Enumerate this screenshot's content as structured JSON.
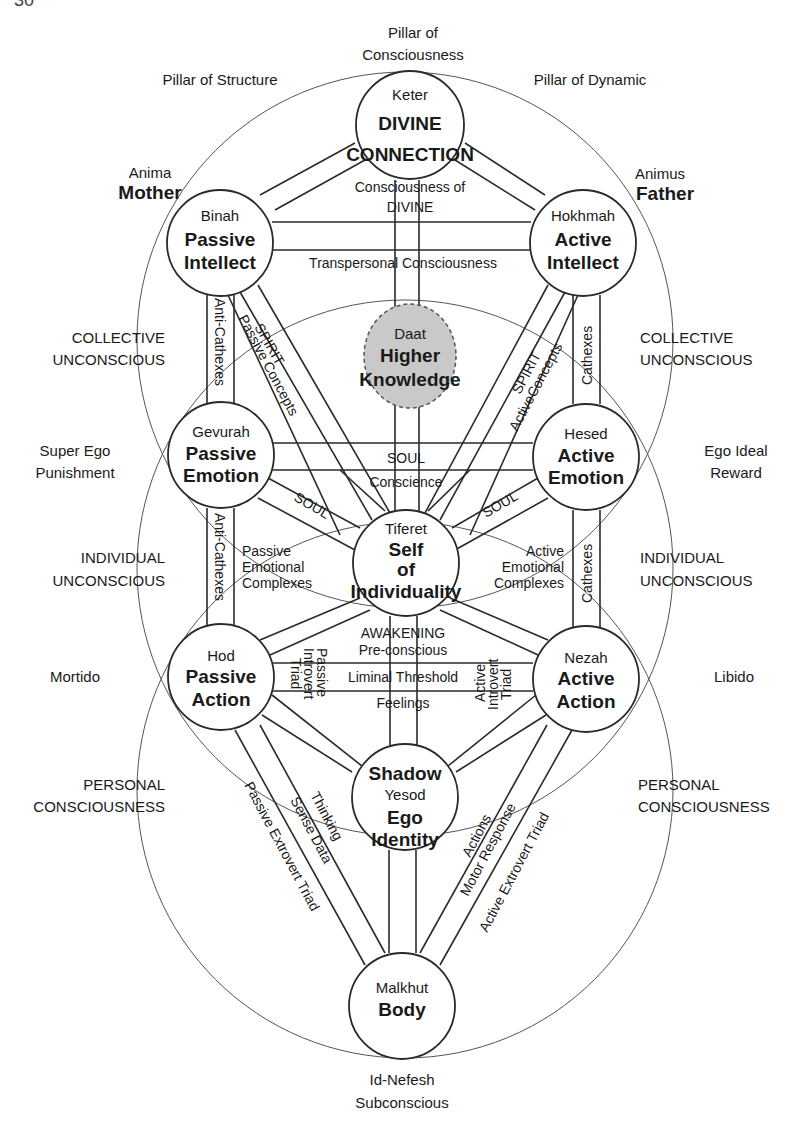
{
  "page_number": "30",
  "pillars": {
    "consciousness": [
      "Pillar of",
      "Consciousness"
    ],
    "structure": "Pillar of Structure",
    "dynamic": "Pillar of Dynamic"
  },
  "side_labels": {
    "anima": "Anima",
    "mother": "Mother",
    "animus": "Animus",
    "father": "Father",
    "collective_left": [
      "COLLECTIVE",
      "UNCONSCIOUS"
    ],
    "collective_right": [
      "COLLECTIVE",
      "UNCONSCIOUS"
    ],
    "superego": [
      "Super Ego",
      "Punishment"
    ],
    "egoideal": [
      "Ego Ideal",
      "Reward"
    ],
    "individual_left": [
      "INDIVIDUAL",
      "UNCONSCIOUS"
    ],
    "individual_right": [
      "INDIVIDUAL",
      "UNCONSCIOUS"
    ],
    "mortido": "Mortido",
    "libido": "Libido",
    "personal_left": [
      "PERSONAL",
      "CONSCIOUSNESS"
    ],
    "personal_right": [
      "PERSONAL",
      "CONSCIOUSNESS"
    ],
    "bottom": [
      "Id-Nefesh",
      "Subconscious"
    ]
  },
  "nodes": {
    "keter": {
      "name": "Keter",
      "lines": [
        "DIVINE",
        "CONNECTION"
      ]
    },
    "binah": {
      "name": "Binah",
      "lines": [
        "Passive",
        "Intellect"
      ]
    },
    "hokhmah": {
      "name": "Hokhmah",
      "lines": [
        "Active",
        "Intellect"
      ]
    },
    "daat": {
      "name": "Daat",
      "lines": [
        "Higher",
        "Knowledge"
      ]
    },
    "gevurah": {
      "name": "Gevurah",
      "lines": [
        "Passive",
        "Emotion"
      ]
    },
    "hesed": {
      "name": "Hesed",
      "lines": [
        "Active",
        "Emotion"
      ]
    },
    "tiferet": {
      "name": "Tiferet",
      "lines": [
        "Self",
        "of",
        "Individuality"
      ]
    },
    "hod": {
      "name": "Hod",
      "lines": [
        "Passive",
        "Action"
      ]
    },
    "nezah": {
      "name": "Nezah",
      "lines": [
        "Active",
        "Action"
      ]
    },
    "yesod": {
      "top": "Shadow",
      "name": "Yesod",
      "lines": [
        "Ego",
        "Identity"
      ]
    },
    "malkhut": {
      "name": "Malkhut",
      "lines": [
        "Body"
      ]
    }
  },
  "paths": {
    "consciousness_of_divine": [
      "Consciousness of",
      "DIVINE"
    ],
    "transpersonal": "Transpersonal Consciousness",
    "anti_cathexes": "Anti-Cathexes",
    "cathexes": "Cathexes",
    "spirit": "SPIRIT",
    "passive_concepts": "Passive Concepts",
    "active_concepts": "ActiveConcepts",
    "soul": "SOUL",
    "conscience": "Conscience",
    "passive_emotional": [
      "Passive",
      "Emotional",
      "Complexes"
    ],
    "active_emotional": [
      "Active",
      "Emotional",
      "Complexes"
    ],
    "awakening": "AWAKENING",
    "preconscious": "Pre-conscious",
    "liminal": "Liminal Threshold",
    "feelings": "Feelings",
    "passive_introvert": [
      "Passive",
      "Introvert",
      "Triad"
    ],
    "active_introvert": [
      "Active",
      "Introvert",
      "Triad"
    ],
    "thinking": "Thinking",
    "sense_data": "Sense Data",
    "passive_extrovert": "Passive Extrovert Triad",
    "actions": "Actions",
    "motor_response": "Motor Response",
    "active_extrovert": "Active Extrovert Triad"
  }
}
